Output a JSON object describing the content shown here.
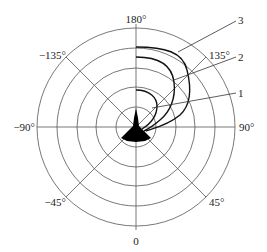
{
  "diagram": {
    "type": "polar-radiation-pattern",
    "center": [
      136,
      127
    ],
    "ring_radii": [
      20,
      40,
      59,
      79,
      99
    ],
    "colors": {
      "grid": "#555555",
      "curve": "#111111",
      "aircraft": "#000000",
      "background": "#ffffff"
    },
    "angle_labels": {
      "top": "180°",
      "upper_right": "135°",
      "right": "90°",
      "lower_right": "45°",
      "bottom": "0",
      "lower_left": "−45°",
      "left": "−90°",
      "upper_left": "−135°"
    },
    "curve_labels": {
      "curve_1": "1",
      "curve_2": "2",
      "curve_3": "3"
    },
    "center_icon": "aircraft-silhouette-icon"
  }
}
